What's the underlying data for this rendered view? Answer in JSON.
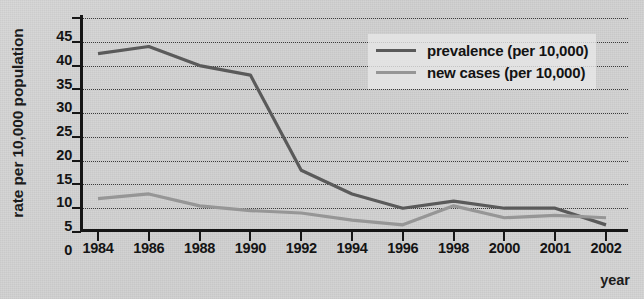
{
  "chart_data": {
    "type": "line",
    "title": "",
    "subtitle": "",
    "xlabel": "year",
    "ylabel": "rate per 10,000 population",
    "categories": [
      "1984",
      "1986",
      "1988",
      "1990",
      "1992",
      "1994",
      "1996",
      "1998",
      "2000",
      "2001",
      "2002"
    ],
    "x": [
      1984,
      1986,
      1988,
      1990,
      1992,
      1994,
      1996,
      1998,
      2000,
      2001,
      2002
    ],
    "series": [
      {
        "name": "prevalence (per 10,000)",
        "color": "#5a5a5a",
        "values": [
          37.5,
          39,
          35,
          33,
          13,
          8,
          5,
          6.5,
          5,
          5,
          1.5
        ]
      },
      {
        "name": "new cases (per 10,000)",
        "color": "#969696",
        "values": [
          7,
          8,
          5.5,
          4.5,
          4,
          2.5,
          1.5,
          5.5,
          3,
          3.5,
          3
        ]
      }
    ],
    "ylim": [
      0,
      45
    ],
    "ytick_step": 5,
    "yticks": [
      "45",
      "40",
      "35",
      "30",
      "25",
      "20",
      "15",
      "10",
      "5",
      "0"
    ],
    "ytick_values": [
      45,
      40,
      35,
      30,
      25,
      20,
      15,
      10,
      5,
      0
    ],
    "grid": "horizontal-dotted",
    "legend_position": "upper-right",
    "legend": [
      "prevalence (per 10,000)",
      "new cases (per 10,000)"
    ]
  },
  "colors": {
    "background": "#d2d2d2",
    "axis": "#161616",
    "grid": "#3a3a3a",
    "text": "#141414",
    "prevalence": "#5a5a5a",
    "new_cases": "#969696",
    "legend_background": "#e7e7e7"
  }
}
